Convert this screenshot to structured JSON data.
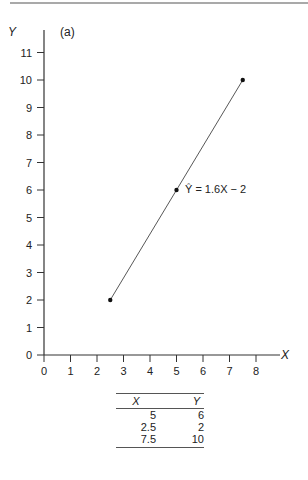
{
  "chart_data": {
    "type": "line",
    "title": "(a)",
    "xlabel": "X",
    "ylabel": "Y",
    "xlim": [
      0,
      8
    ],
    "ylim": [
      0,
      11
    ],
    "x_ticks": [
      "0",
      "1",
      "2",
      "3",
      "4",
      "5",
      "6",
      "7",
      "8"
    ],
    "y_ticks": [
      "0",
      "1",
      "2",
      "3",
      "4",
      "5",
      "6",
      "7",
      "8",
      "9",
      "10",
      "11"
    ],
    "grid": false,
    "series": [
      {
        "name": "Ŷ = 1.6X − 2",
        "x": [
          2.5,
          5,
          7.5
        ],
        "y": [
          2,
          6,
          10
        ]
      }
    ],
    "annotations": [
      {
        "text": "Ŷ = 1.6X − 2",
        "x": 5,
        "y": 6
      }
    ]
  },
  "panel_label": "(a)",
  "axis": {
    "x_title": "X",
    "y_title": "Y"
  },
  "equation_label": "Ŷ = 1.6X − 2",
  "table": {
    "headers": [
      "X",
      "Y"
    ],
    "rows": [
      [
        "5",
        "6"
      ],
      [
        "2.5",
        "2"
      ],
      [
        "7.5",
        "10"
      ]
    ]
  }
}
